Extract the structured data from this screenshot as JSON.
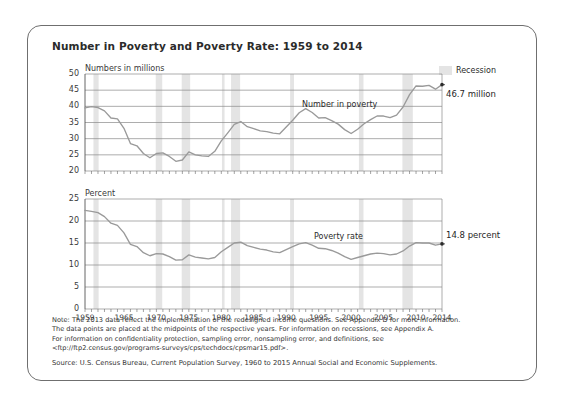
{
  "figure": {
    "title": "Number in Poverty and Poverty Rate: 1959 to 2014",
    "legend": {
      "recession_label": "Recession",
      "recession_color": "#e4e4e4"
    },
    "line_color": "#9a9a9a",
    "grid_color": "#8a8a8a",
    "notes": [
      "Note: The 2013 data reflect the implementation of the redesigned income questions. See Appendix D for more information.",
      "The data points are placed at the midpoints of the respective years. For information on recessions, see Appendix A.",
      "For information on confidentiality protection, sampling error, nonsampling error, and definitions, see",
      "<ftp://ftp2.census.gov/programs-surveys/cps/techdocs/cpsmar15.pdf>."
    ],
    "source": "Source: U.S. Census Bureau, Current Population Survey, 1960 to 2015 Annual Social and Economic Supplements."
  },
  "chart_data": [
    {
      "type": "line",
      "id": "number-in-poverty",
      "title": "Number in poverty",
      "ylabel": "Numbers in millions",
      "xlabel": "",
      "ylim": [
        20,
        50
      ],
      "yticks": [
        20,
        25,
        30,
        35,
        40,
        45,
        50
      ],
      "ytick_labels": [
        "20",
        "25",
        "30",
        "35",
        "40",
        "45",
        "50"
      ],
      "xlim": [
        1959,
        2014
      ],
      "xticks": [
        1959,
        1965,
        1970,
        1975,
        1980,
        1985,
        1990,
        1995,
        2000,
        2005,
        2010,
        2014
      ],
      "xtick_labels": [
        "1959",
        "1965",
        "1970",
        "1975",
        "1980",
        "1985",
        "1990",
        "1995",
        "2000",
        "2005",
        "2010",
        "2014"
      ],
      "grid": true,
      "series_label_text": "Number in poverty",
      "end_annotation": "46.7 million",
      "x": [
        1959,
        1960,
        1961,
        1962,
        1963,
        1964,
        1965,
        1966,
        1967,
        1968,
        1969,
        1970,
        1971,
        1972,
        1973,
        1974,
        1975,
        1976,
        1977,
        1978,
        1979,
        1980,
        1981,
        1982,
        1983,
        1984,
        1985,
        1986,
        1987,
        1988,
        1989,
        1990,
        1991,
        1992,
        1993,
        1994,
        1995,
        1996,
        1997,
        1998,
        1999,
        2000,
        2001,
        2002,
        2003,
        2004,
        2005,
        2006,
        2007,
        2008,
        2009,
        2010,
        2011,
        2012,
        2013,
        2014
      ],
      "values": [
        39.5,
        39.9,
        39.6,
        38.6,
        36.4,
        36.1,
        33.2,
        28.5,
        27.8,
        25.4,
        24.1,
        25.4,
        25.6,
        24.5,
        23.0,
        23.4,
        25.9,
        25.0,
        24.7,
        24.5,
        26.1,
        29.3,
        31.8,
        34.4,
        35.3,
        33.7,
        33.1,
        32.4,
        32.2,
        31.7,
        31.5,
        33.6,
        35.7,
        38.0,
        39.3,
        38.1,
        36.4,
        36.5,
        35.6,
        34.5,
        32.8,
        31.6,
        32.9,
        34.6,
        35.9,
        37.0,
        37.0,
        36.5,
        37.3,
        39.8,
        43.6,
        46.3,
        46.2,
        46.5,
        45.3,
        46.7
      ],
      "recessions": [
        [
          1960.3,
          1961.1
        ],
        [
          1969.9,
          1970.9
        ],
        [
          1973.9,
          1975.2
        ],
        [
          1980.1,
          1980.5
        ],
        [
          1981.5,
          1982.9
        ],
        [
          1990.6,
          1991.2
        ],
        [
          2001.2,
          2001.9
        ],
        [
          2007.9,
          2009.5
        ]
      ]
    },
    {
      "type": "line",
      "id": "poverty-rate",
      "title": "Poverty rate",
      "ylabel": "Percent",
      "xlabel": "",
      "ylim": [
        0,
        25
      ],
      "yticks": [
        0,
        5,
        10,
        15,
        20,
        25
      ],
      "ytick_labels": [
        "0",
        "5",
        "10",
        "15",
        "20",
        "25"
      ],
      "xlim": [
        1959,
        2014
      ],
      "xticks": [
        1959,
        1965,
        1970,
        1975,
        1980,
        1985,
        1990,
        1995,
        2000,
        2005,
        2010,
        2014
      ],
      "xtick_labels": [
        "1959",
        "1965",
        "1970",
        "1975",
        "1980",
        "1985",
        "1990",
        "1995",
        "2000",
        "2005",
        "2010",
        "2014"
      ],
      "grid": true,
      "series_label_text": "Poverty rate",
      "end_annotation": "14.8 percent",
      "x": [
        1959,
        1960,
        1961,
        1962,
        1963,
        1964,
        1965,
        1966,
        1967,
        1968,
        1969,
        1970,
        1971,
        1972,
        1973,
        1974,
        1975,
        1976,
        1977,
        1978,
        1979,
        1980,
        1981,
        1982,
        1983,
        1984,
        1985,
        1986,
        1987,
        1988,
        1989,
        1990,
        1991,
        1992,
        1993,
        1994,
        1995,
        1996,
        1997,
        1998,
        1999,
        2000,
        2001,
        2002,
        2003,
        2004,
        2005,
        2006,
        2007,
        2008,
        2009,
        2010,
        2011,
        2012,
        2013,
        2014
      ],
      "values": [
        22.4,
        22.2,
        21.9,
        21.0,
        19.5,
        19.0,
        17.3,
        14.7,
        14.2,
        12.8,
        12.1,
        12.6,
        12.5,
        11.9,
        11.1,
        11.2,
        12.3,
        11.8,
        11.6,
        11.4,
        11.7,
        13.0,
        14.0,
        15.0,
        15.2,
        14.4,
        14.0,
        13.6,
        13.4,
        13.0,
        12.8,
        13.5,
        14.2,
        14.8,
        15.1,
        14.5,
        13.8,
        13.7,
        13.3,
        12.7,
        11.9,
        11.3,
        11.7,
        12.1,
        12.5,
        12.7,
        12.6,
        12.3,
        12.5,
        13.2,
        14.3,
        15.1,
        15.0,
        15.0,
        14.5,
        14.8
      ],
      "recessions": [
        [
          1960.3,
          1961.1
        ],
        [
          1969.9,
          1970.9
        ],
        [
          1973.9,
          1975.2
        ],
        [
          1980.1,
          1980.5
        ],
        [
          1981.5,
          1982.9
        ],
        [
          1990.6,
          1991.2
        ],
        [
          2001.2,
          2001.9
        ],
        [
          2007.9,
          2009.5
        ]
      ]
    }
  ]
}
